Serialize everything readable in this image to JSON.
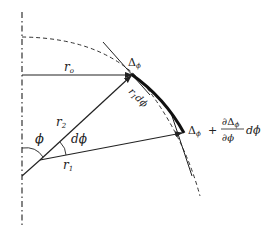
{
  "diagram": {
    "colors": {
      "line": "#222222",
      "axis": "#333333",
      "background": "#ffffff"
    },
    "labels": {
      "r_o": {
        "main": "r",
        "sub": "o"
      },
      "r_1": {
        "main": "r",
        "sub": "1"
      },
      "r_2": {
        "main": "r",
        "sub": "2"
      },
      "phi": "ϕ",
      "dphi": "dϕ",
      "arc_length": {
        "main": "r",
        "sub": "1",
        "tail": "dϕ"
      },
      "delta_top": {
        "main": "Δ",
        "sub": "ϕ"
      },
      "delta_bottom": {
        "lhs_main": "Δ",
        "lhs_sub": "ϕ",
        "plus": "+",
        "numerator_main": "∂Δ",
        "numerator_sub": "ϕ",
        "denominator": "∂ϕ",
        "tail": "dϕ"
      }
    },
    "elements": [
      "dash-dot vertical symmetry axis",
      "dashed circular arc",
      "horizontal arrow r_o",
      "arrow r_2",
      "arrow r_1",
      "angle arc phi",
      "angle arc dphi",
      "thick boundary arc",
      "tangent line top",
      "tangent line bottom"
    ]
  }
}
